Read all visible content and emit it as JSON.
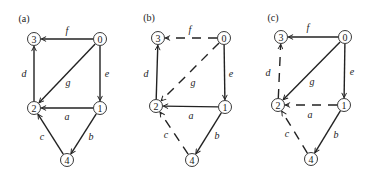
{
  "panels": [
    {
      "label": "(a)",
      "label_pos": [
        24,
        18
      ],
      "nodes": [
        {
          "id": "0",
          "x": 100,
          "y": 39
        },
        {
          "id": "1",
          "x": 100,
          "y": 108
        },
        {
          "id": "2",
          "x": 34,
          "y": 108
        },
        {
          "id": "3",
          "x": 34,
          "y": 39
        },
        {
          "id": "4",
          "x": 67,
          "y": 160
        }
      ],
      "edges": [
        {
          "name": "f",
          "from": "0",
          "to": "3",
          "style": "solid",
          "label_pos": [
            67,
            30
          ]
        },
        {
          "name": "e",
          "from": "0",
          "to": "1",
          "style": "solid",
          "label_pos": [
            107,
            73
          ]
        },
        {
          "name": "g",
          "from": "0",
          "to": "2",
          "style": "solid",
          "label_pos": [
            68,
            82
          ]
        },
        {
          "name": "d",
          "from": "2",
          "to": "3",
          "style": "solid",
          "label_pos": [
            24,
            73
          ]
        },
        {
          "name": "a",
          "from": "1",
          "to": "2",
          "style": "solid",
          "label_pos": [
            67,
            116
          ]
        },
        {
          "name": "b",
          "from": "1",
          "to": "4",
          "style": "solid",
          "label_pos": [
            91,
            136
          ]
        },
        {
          "name": "c",
          "from": "4",
          "to": "2",
          "style": "solid",
          "label_pos": [
            42,
            136
          ]
        }
      ]
    },
    {
      "label": "(b)",
      "label_pos": [
        149,
        17
      ],
      "nodes": [
        {
          "id": "0",
          "x": 224,
          "y": 38
        },
        {
          "id": "1",
          "x": 225,
          "y": 107
        },
        {
          "id": "2",
          "x": 156,
          "y": 106
        },
        {
          "id": "3",
          "x": 158,
          "y": 38
        },
        {
          "id": "4",
          "x": 192,
          "y": 160
        }
      ],
      "edges": [
        {
          "name": "f",
          "from": "0",
          "to": "3",
          "style": "dashed",
          "label_pos": [
            190,
            29
          ]
        },
        {
          "name": "e",
          "from": "0",
          "to": "1",
          "style": "solid",
          "label_pos": [
            231,
            73
          ]
        },
        {
          "name": "g",
          "from": "0",
          "to": "2",
          "style": "dashed",
          "label_pos": [
            193,
            82
          ]
        },
        {
          "name": "d",
          "from": "2",
          "to": "3",
          "style": "solid",
          "label_pos": [
            146,
            73
          ]
        },
        {
          "name": "a",
          "from": "1",
          "to": "2",
          "style": "solid",
          "label_pos": [
            191,
            115
          ]
        },
        {
          "name": "b",
          "from": "1",
          "to": "4",
          "style": "solid",
          "label_pos": [
            217,
            135
          ]
        },
        {
          "name": "c",
          "from": "4",
          "to": "2",
          "style": "dashed",
          "label_pos": [
            166,
            134
          ]
        }
      ]
    },
    {
      "label": "(c)",
      "label_pos": [
        273,
        17
      ],
      "nodes": [
        {
          "id": "0",
          "x": 345,
          "y": 37
        },
        {
          "id": "1",
          "x": 344,
          "y": 105
        },
        {
          "id": "2",
          "x": 278,
          "y": 105
        },
        {
          "id": "3",
          "x": 281,
          "y": 37
        },
        {
          "id": "4",
          "x": 311,
          "y": 159
        }
      ],
      "edges": [
        {
          "name": "f",
          "from": "0",
          "to": "3",
          "style": "solid",
          "label_pos": [
            308,
            27
          ]
        },
        {
          "name": "e",
          "from": "0",
          "to": "1",
          "style": "solid",
          "label_pos": [
            352,
            71
          ]
        },
        {
          "name": "g",
          "from": "0",
          "to": "2",
          "style": "solid",
          "label_pos": [
            312,
            81
          ]
        },
        {
          "name": "d",
          "from": "2",
          "to": "3",
          "style": "dashed",
          "label_pos": [
            268,
            72
          ]
        },
        {
          "name": "a",
          "from": "1",
          "to": "2",
          "style": "dashed",
          "label_pos": [
            310,
            114
          ]
        },
        {
          "name": "b",
          "from": "1",
          "to": "4",
          "style": "solid",
          "label_pos": [
            336,
            134
          ]
        },
        {
          "name": "c",
          "from": "4",
          "to": "2",
          "style": "dashed",
          "label_pos": [
            287,
            133
          ]
        }
      ]
    }
  ],
  "style": {
    "node_radius": 6.5,
    "ink": "#222222",
    "background": "#ffffff"
  }
}
